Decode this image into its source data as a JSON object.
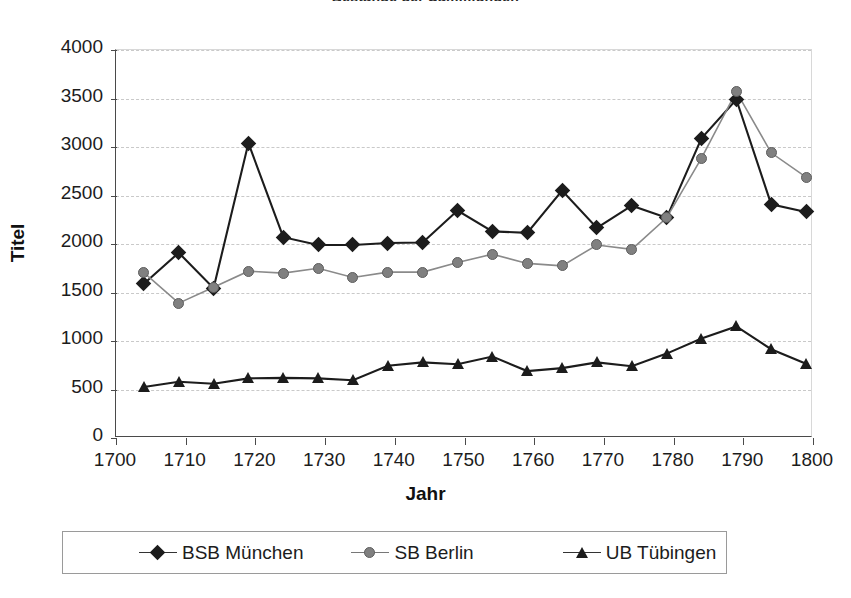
{
  "chart_data": {
    "type": "line",
    "title": "Bestände der Sammlungen",
    "xlabel": "Jahr",
    "ylabel": "Titel",
    "xlim": [
      1700,
      1800
    ],
    "ylim": [
      0,
      4000
    ],
    "ytick_step": 500,
    "xtick_step": 10,
    "grid": true,
    "legend_position": "bottom",
    "x": [
      1704,
      1709,
      1714,
      1719,
      1724,
      1729,
      1734,
      1739,
      1744,
      1749,
      1754,
      1759,
      1764,
      1769,
      1774,
      1779,
      1784,
      1789,
      1794,
      1799
    ],
    "xticklabels": [
      "1700",
      "1710",
      "1720",
      "1730",
      "1740",
      "1750",
      "1760",
      "1770",
      "1780",
      "1790",
      "1800"
    ],
    "yticklabels": [
      "0",
      "500",
      "1000",
      "1500",
      "2000",
      "2500",
      "3000",
      "3500",
      "4000"
    ],
    "series": [
      {
        "name": "BSB München",
        "marker": "diamond",
        "color": "#1c1c1c",
        "values": [
          1590,
          1910,
          1545,
          3040,
          2070,
          1990,
          1990,
          2010,
          2015,
          2345,
          2130,
          2115,
          2550,
          2165,
          2395,
          2270,
          3090,
          3490,
          2410,
          2330
        ]
      },
      {
        "name": "SB Berlin",
        "marker": "circle",
        "color": "#808080",
        "values": [
          1705,
          1390,
          1555,
          1720,
          1700,
          1750,
          1655,
          1710,
          1710,
          1810,
          1895,
          1800,
          1775,
          1990,
          1945,
          2270,
          2885,
          3570,
          2940,
          2690
        ]
      },
      {
        "name": "UB Tübingen",
        "marker": "triangle",
        "color": "#1c1c1c",
        "values": [
          525,
          580,
          560,
          615,
          620,
          615,
          595,
          745,
          780,
          760,
          840,
          690,
          720,
          780,
          740,
          870,
          1025,
          1150,
          915,
          765
        ]
      }
    ]
  },
  "legend": {
    "items": [
      {
        "label": "BSB München",
        "marker": "diamond"
      },
      {
        "label": "SB Berlin",
        "marker": "circle"
      },
      {
        "label": "UB Tübingen",
        "marker": "triangle"
      }
    ]
  }
}
